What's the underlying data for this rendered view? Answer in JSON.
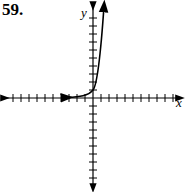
{
  "problem_number": "59.",
  "chart_data": {
    "type": "line",
    "title": "",
    "xlabel": "x",
    "ylabel": "y",
    "xlim": [
      -10,
      10
    ],
    "ylim": [
      -10,
      10
    ],
    "grid": false,
    "function": "y = 2^x (exponential growth)",
    "series": [
      {
        "name": "curve",
        "x": [
          -3,
          -2,
          -1,
          0,
          1,
          1.5
        ],
        "y": [
          0.125,
          0.25,
          0.5,
          1,
          2,
          11
        ]
      }
    ]
  }
}
